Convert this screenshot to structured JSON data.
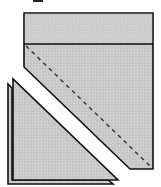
{
  "diagram": {
    "colors": {
      "fill": "#c9c9c9",
      "fill_light": "#cfcfcf",
      "stroke": "#111111",
      "background": "#ffffff"
    },
    "shapes": [
      {
        "name": "top-band",
        "type": "rect"
      },
      {
        "name": "main-piece",
        "type": "polygon"
      },
      {
        "name": "fold-line",
        "type": "dashed-line"
      },
      {
        "name": "cut-triangle-back",
        "type": "triangle"
      },
      {
        "name": "cut-triangle-front",
        "type": "triangle"
      }
    ]
  }
}
